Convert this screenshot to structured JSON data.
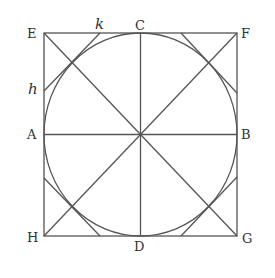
{
  "diagram": {
    "type": "geometry",
    "stroke_color": "#555555",
    "labels": {
      "E": "E",
      "F": "F",
      "G": "G",
      "H": "H",
      "A": "A",
      "B": "B",
      "C": "C",
      "D": "D",
      "h": "h",
      "k": "k"
    }
  }
}
